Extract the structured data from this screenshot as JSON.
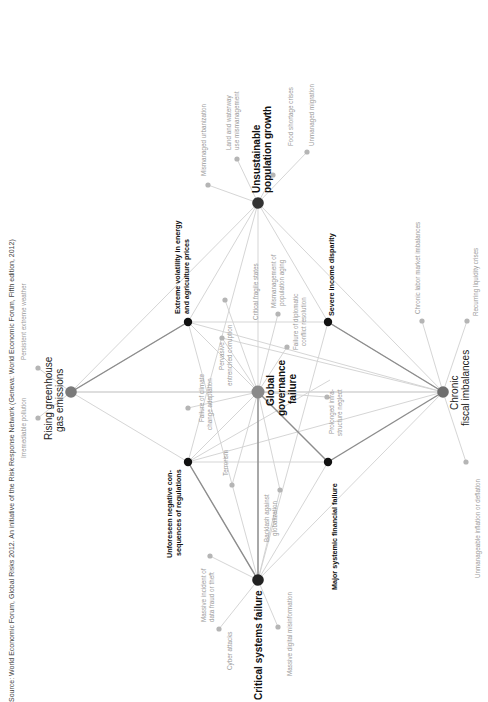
{
  "source": "Source: World Economic Forum, Global Risks 2012. An initiative of the Risk Response Network (Geneva: World Economic Forum, Fifth edition, 2012)",
  "colors": {
    "major_node": "#777777",
    "center_node": "#8a8a8a",
    "mid_node": "#111111",
    "minor_node": "#b5b5b5",
    "edge_light": "#cfcfcf",
    "edge_dark": "#888888",
    "minor_text": "#9a9a9a"
  },
  "major_nodes": {
    "ghg": {
      "label1": "Rising greenhouse",
      "label2": "gas emissions"
    },
    "population": {
      "label1": "Unsustainable",
      "label2": "population growth"
    },
    "governance": {
      "label1": "Global",
      "label2": "governance",
      "label3": "failure"
    },
    "fiscal": {
      "label1": "Chronic",
      "label2": "fiscal imbalances"
    },
    "critical": {
      "label1": "Critical systems failure"
    }
  },
  "mid_nodes": {
    "volatility": {
      "label1": "Extreme volatility in energy",
      "label2": "and agriculture prices"
    },
    "unforeseen": {
      "label1": "Unforeseen negative con-",
      "label2": "sequences of regulations"
    },
    "income": {
      "label1": "Severe income disparity"
    },
    "financial": {
      "label1": "Major systemic financial failure"
    }
  },
  "minor_nodes": {
    "pollution": "Irremediable pollution",
    "weather": "Persistent extreme weather",
    "urbanization": "Mismanaged urbanization",
    "land1": "Land and waterway",
    "land2": "use mismanagement",
    "food": "Food shortage crises",
    "migration": "Unmanaged migration",
    "climate1": "Failure of climate",
    "climate2": "change adaptation",
    "corruption1": "Pervasive",
    "corruption2": "entrenched corruption",
    "fragile": "Critical fragile states",
    "aging1": "Mismanagement of",
    "aging2": "population aging",
    "diplomatic1": "Failure of diplomatic",
    "diplomatic2": "conflict resolution",
    "terrorism": "Terrorism",
    "backlash1": "Backlash against",
    "backlash2": "globalization",
    "infra1": "Prolonged infra-",
    "infra2": "structure neglect",
    "datafraud1": "Massive incident of",
    "datafraud2": "data fraud or theft",
    "cyber": "Cyber attacks",
    "misinfo": "Massive digital misinformation",
    "labor": "Chronic labor market imbalances",
    "liquidity": "Recurring liquidity crises",
    "inflation": "Unmanageable inflation or deflation"
  }
}
